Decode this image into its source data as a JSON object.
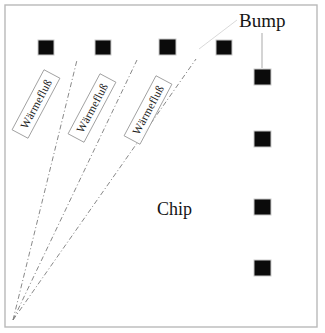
{
  "diagram": {
    "width": 325,
    "height": 333,
    "background_color": "#ffffff",
    "frame": {
      "stroke_color": "#b9b9b9",
      "x": 5,
      "y": 5,
      "width": 312,
      "height": 322
    },
    "labels": {
      "bump": "Bump",
      "chip": "Chip",
      "heat_flow_1": "Wärmefluß",
      "heat_flow_2": "Wärmefluß",
      "heat_flow_3": "Wärmefluß"
    },
    "bump_color": "#0b0b0b",
    "ray_color": "#7b7b7b",
    "leader_color": "#9a9a9a",
    "origin": {
      "x": 13,
      "y": 320
    },
    "bumps_top_row": [
      {
        "x": 38,
        "y": 40,
        "w": 16,
        "h": 15
      },
      {
        "x": 95,
        "y": 40,
        "w": 16,
        "h": 15
      },
      {
        "x": 159,
        "y": 39,
        "w": 17,
        "h": 16
      },
      {
        "x": 216,
        "y": 40,
        "w": 16,
        "h": 15
      }
    ],
    "bumps_right_column": [
      {
        "x": 254,
        "y": 69,
        "w": 17,
        "h": 16
      },
      {
        "x": 254,
        "y": 131,
        "w": 17,
        "h": 16
      },
      {
        "x": 254,
        "y": 199,
        "w": 17,
        "h": 16
      },
      {
        "x": 254,
        "y": 260,
        "w": 17,
        "h": 16
      }
    ],
    "rays": [
      {
        "x1": 13,
        "y1": 320,
        "x2": 77,
        "y2": 60
      },
      {
        "x1": 13,
        "y1": 320,
        "x2": 137,
        "y2": 60
      },
      {
        "x1": 13,
        "y1": 320,
        "x2": 196,
        "y2": 59
      }
    ],
    "flow_labels": [
      {
        "cx": 36,
        "cy": 104,
        "rotation": -62
      },
      {
        "cx": 92,
        "cy": 108,
        "rotation": -62
      },
      {
        "cx": 148,
        "cy": 110,
        "rotation": -62
      }
    ],
    "bump_callout": {
      "text_x": 239,
      "text_y": 27,
      "leader_x1": 262,
      "leader_y1": 33,
      "leader_x2": 262,
      "leader_y2": 68,
      "faint_x1": 199,
      "faint_y1": 49,
      "faint_x2": 237,
      "faint_y2": 20
    },
    "chip_label": {
      "x": 157,
      "y": 215
    }
  }
}
